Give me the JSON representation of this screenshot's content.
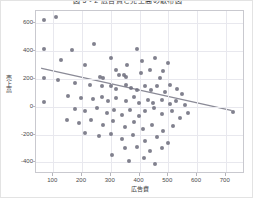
{
  "chart_data": {
    "type": "scatter",
    "title": "図 5 - 2    広告費と売上高の散布図",
    "xlabel": "広告費",
    "ylabel": "売上高",
    "xlim": [
      40,
      760
    ],
    "ylim": [
      -470,
      690
    ],
    "xticks": [
      100,
      200,
      300,
      400,
      500,
      600,
      700
    ],
    "yticks": [
      600,
      400,
      200,
      0,
      -200,
      -400
    ],
    "grid": true,
    "legend": "none",
    "marker_color": "#6f6f7e",
    "trendline_color": "#8b8b97",
    "trendline": {
      "x": [
        60,
        725
      ],
      "y": [
        272,
        -35
      ]
    },
    "points": [
      {
        "x": 68,
        "y": 628
      },
      {
        "x": 110,
        "y": 648
      },
      {
        "x": 68,
        "y": 418
      },
      {
        "x": 165,
        "y": 408
      },
      {
        "x": 240,
        "y": 452
      },
      {
        "x": 128,
        "y": 338
      },
      {
        "x": 212,
        "y": 300
      },
      {
        "x": 300,
        "y": 352
      },
      {
        "x": 355,
        "y": 300
      },
      {
        "x": 392,
        "y": 418
      },
      {
        "x": 410,
        "y": 330
      },
      {
        "x": 455,
        "y": 348
      },
      {
        "x": 318,
        "y": 262
      },
      {
        "x": 262,
        "y": 212
      },
      {
        "x": 272,
        "y": 210
      },
      {
        "x": 330,
        "y": 232
      },
      {
        "x": 345,
        "y": 228
      },
      {
        "x": 352,
        "y": 214
      },
      {
        "x": 405,
        "y": 245
      },
      {
        "x": 438,
        "y": 264
      },
      {
        "x": 470,
        "y": 210
      },
      {
        "x": 480,
        "y": 256
      },
      {
        "x": 500,
        "y": 318
      },
      {
        "x": 68,
        "y": 208
      },
      {
        "x": 118,
        "y": 192
      },
      {
        "x": 175,
        "y": 168
      },
      {
        "x": 228,
        "y": 160
      },
      {
        "x": 268,
        "y": 148
      },
      {
        "x": 300,
        "y": 152
      },
      {
        "x": 318,
        "y": 126
      },
      {
        "x": 352,
        "y": 160
      },
      {
        "x": 372,
        "y": 138
      },
      {
        "x": 392,
        "y": 118
      },
      {
        "x": 418,
        "y": 148
      },
      {
        "x": 440,
        "y": 120
      },
      {
        "x": 462,
        "y": 150
      },
      {
        "x": 488,
        "y": 110
      },
      {
        "x": 505,
        "y": 158
      },
      {
        "x": 530,
        "y": 130
      },
      {
        "x": 548,
        "y": 90
      },
      {
        "x": 152,
        "y": 80
      },
      {
        "x": 198,
        "y": 62
      },
      {
        "x": 238,
        "y": 58
      },
      {
        "x": 270,
        "y": 72
      },
      {
        "x": 292,
        "y": 40
      },
      {
        "x": 318,
        "y": 62
      },
      {
        "x": 352,
        "y": 38
      },
      {
        "x": 382,
        "y": 70
      },
      {
        "x": 398,
        "y": 28
      },
      {
        "x": 428,
        "y": 52
      },
      {
        "x": 448,
        "y": 30
      },
      {
        "x": 478,
        "y": 48
      },
      {
        "x": 505,
        "y": 22
      },
      {
        "x": 528,
        "y": 38
      },
      {
        "x": 558,
        "y": 10
      },
      {
        "x": 68,
        "y": 32
      },
      {
        "x": 725,
        "y": -35
      },
      {
        "x": 175,
        "y": -18
      },
      {
        "x": 212,
        "y": -30
      },
      {
        "x": 252,
        "y": -12
      },
      {
        "x": 288,
        "y": -48
      },
      {
        "x": 312,
        "y": -20
      },
      {
        "x": 340,
        "y": -58
      },
      {
        "x": 368,
        "y": -22
      },
      {
        "x": 398,
        "y": -65
      },
      {
        "x": 420,
        "y": -28
      },
      {
        "x": 452,
        "y": -12
      },
      {
        "x": 478,
        "y": -52
      },
      {
        "x": 512,
        "y": -30
      },
      {
        "x": 540,
        "y": -78
      },
      {
        "x": 568,
        "y": -42
      },
      {
        "x": 148,
        "y": -92
      },
      {
        "x": 190,
        "y": -118
      },
      {
        "x": 232,
        "y": -98
      },
      {
        "x": 272,
        "y": -130
      },
      {
        "x": 308,
        "y": -105
      },
      {
        "x": 348,
        "y": -148
      },
      {
        "x": 382,
        "y": -112
      },
      {
        "x": 412,
        "y": -160
      },
      {
        "x": 445,
        "y": -128
      },
      {
        "x": 482,
        "y": -175
      },
      {
        "x": 518,
        "y": -140
      },
      {
        "x": 212,
        "y": -188
      },
      {
        "x": 258,
        "y": -212
      },
      {
        "x": 300,
        "y": -196
      },
      {
        "x": 340,
        "y": -232
      },
      {
        "x": 378,
        "y": -205
      },
      {
        "x": 418,
        "y": -248
      },
      {
        "x": 460,
        "y": -218
      },
      {
        "x": 500,
        "y": -262
      },
      {
        "x": 348,
        "y": -300
      },
      {
        "x": 392,
        "y": -288
      },
      {
        "x": 438,
        "y": -322
      },
      {
        "x": 478,
        "y": -298
      },
      {
        "x": 305,
        "y": -348
      },
      {
        "x": 365,
        "y": -392
      },
      {
        "x": 415,
        "y": -368
      },
      {
        "x": 455,
        "y": -410
      }
    ]
  }
}
